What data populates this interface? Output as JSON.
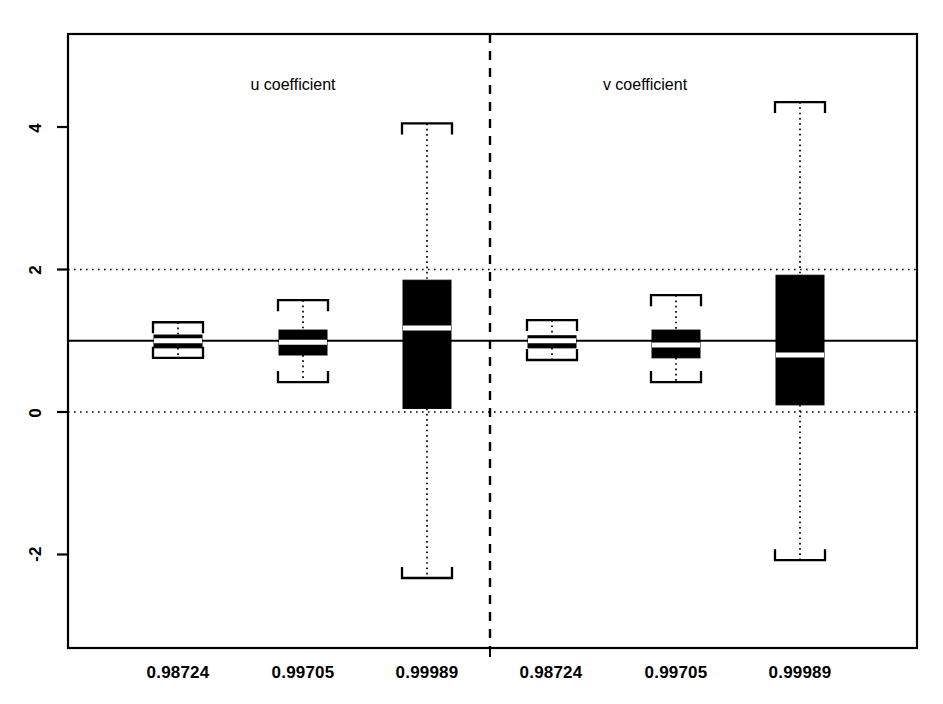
{
  "chart_data": {
    "type": "box",
    "title": "",
    "subtitle": "",
    "xlabel": "",
    "ylabel": "",
    "ylim": [
      -3.2,
      5.4
    ],
    "yticks": [
      4,
      2,
      0,
      -2
    ],
    "ytick_labels": [
      "4",
      "2",
      "0",
      "-2"
    ],
    "grid": "horizontal dotted gridlines at y = 2 and y = 0",
    "legend_position": "none",
    "reference_line": {
      "value": 1,
      "style": "solid",
      "orientation": "horizontal"
    },
    "panel_divider": {
      "style": "dashed",
      "orientation": "vertical",
      "position_between": [
        "u coefficient",
        "v coefficient"
      ]
    },
    "panels": [
      {
        "label": "u coefficient",
        "categories": [
          "0.98724",
          "0.99705",
          "0.99989"
        ],
        "boxes": [
          {
            "category": "0.98724",
            "whisker_low": 0.76,
            "q1": 0.9,
            "median": 1.0,
            "q3": 1.08,
            "whisker_high": 1.26
          },
          {
            "category": "0.99705",
            "whisker_low": 0.42,
            "q1": 0.8,
            "median": 0.98,
            "q3": 1.15,
            "whisker_high": 1.57
          },
          {
            "category": "0.99989",
            "whisker_low": -2.33,
            "q1": 0.05,
            "median": 1.18,
            "q3": 1.85,
            "whisker_high": 4.05
          }
        ]
      },
      {
        "label": "v coefficient",
        "categories": [
          "0.98724",
          "0.99705",
          "0.99989"
        ],
        "boxes": [
          {
            "category": "0.98724",
            "whisker_low": 0.73,
            "q1": 0.9,
            "median": 1.0,
            "q3": 1.07,
            "whisker_high": 1.29
          },
          {
            "category": "0.99705",
            "whisker_low": 0.42,
            "q1": 0.76,
            "median": 0.94,
            "q3": 1.15,
            "whisker_high": 1.64
          },
          {
            "category": "0.99989",
            "whisker_low": -2.08,
            "q1": 0.1,
            "median": 0.8,
            "q3": 1.92,
            "whisker_high": 4.35
          }
        ]
      }
    ],
    "colors": {
      "box_fill": "#000000",
      "median_line": "#ffffff",
      "axis": "#000000",
      "grid": "#000000",
      "background": "#ffffff"
    }
  },
  "axis": {
    "y_tick_labels": [
      "4",
      "2",
      "0",
      "-2"
    ],
    "x_tick_labels": [
      "0.98724",
      "0.99705",
      "0.99989",
      "0.98724",
      "0.99705",
      "0.99989"
    ]
  },
  "panel_titles": [
    "u coefficient",
    "v coefficient"
  ]
}
